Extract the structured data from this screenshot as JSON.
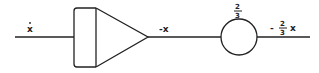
{
  "diagram": {
    "type": "block-diagram",
    "input": {
      "label": "x",
      "derivative_dot": true,
      "text": "ẋ"
    },
    "integrator": {
      "kind": "integrator",
      "output_label": "-x"
    },
    "gain": {
      "kind": "potentiometer",
      "numerator": "2",
      "denominator": "3"
    },
    "output": {
      "sign": "-",
      "numerator": "2",
      "denominator": "3",
      "variable": "x"
    }
  }
}
